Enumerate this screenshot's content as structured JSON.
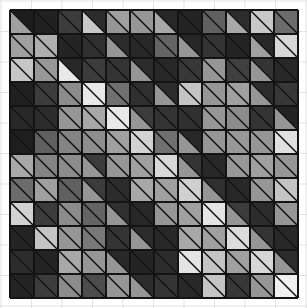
{
  "figure": {
    "kind": "tiling-pattern",
    "canvas": {
      "width": 307,
      "height": 308,
      "background": "#ffffff"
    },
    "background_grid": {
      "visible": true,
      "color": "#e3e3e3",
      "line_width": 1,
      "pitch_x": 30.5,
      "pitch_y": 30.5,
      "origin_x": 1,
      "origin_y": 1
    },
    "tile_block": {
      "origin_x": 10,
      "origin_y": 10,
      "cols": 12,
      "rows": 12,
      "cell_size": 24,
      "split": "anti-diagonal",
      "split_note": "each square tile is divided by the diagonal from its top-left corner to its bottom-right corner; the upper-right triangle and the lower-left triangle are filled independently",
      "seam_color": "#141414",
      "seam_width": 1.6
    },
    "palette": {
      "near_black": "#1d1d1d",
      "very_dark": "#242424",
      "dark": "#2e2e2e",
      "dark_mid": "#3a3a3a",
      "mid": "#555555",
      "mid_light": "#6e6e6e",
      "light": "#8f8f8f",
      "lighter": "#a8a8a8",
      "pale": "#c2c2c2",
      "near_white": "#e8e8e8"
    }
  },
  "chart_data": {
    "type": "heatmap",
    "subtitle": "",
    "xlabel": "",
    "ylabel": "",
    "grid": true,
    "legend": "none",
    "rows": 12,
    "cols": 12,
    "value_range": [
      0,
      255
    ],
    "encoding": "each matrix entry is a pair [upper_right_triangle_gray, lower_left_triangle_gray] given as 8-bit grayscale levels",
    "upper_values": [
      [
        29,
        33,
        60,
        44,
        160,
        150,
        40,
        36,
        96,
        45,
        200,
        108
      ],
      [
        160,
        175,
        36,
        48,
        44,
        40,
        100,
        38,
        52,
        36,
        40,
        215
      ],
      [
        198,
        152,
        40,
        60,
        52,
        44,
        40,
        56,
        150,
        64,
        52,
        40
      ],
      [
        32,
        60,
        140,
        232,
        112,
        48,
        44,
        196,
        150,
        160,
        44,
        56
      ],
      [
        40,
        44,
        150,
        168,
        232,
        60,
        52,
        48,
        150,
        140,
        52,
        36
      ],
      [
        30,
        96,
        132,
        142,
        160,
        210,
        112,
        40,
        150,
        152,
        150,
        224
      ],
      [
        168,
        132,
        140,
        60,
        150,
        160,
        216,
        52,
        40,
        152,
        160,
        150
      ],
      [
        108,
        160,
        96,
        60,
        44,
        168,
        160,
        208,
        48,
        40,
        150,
        196
      ],
      [
        210,
        60,
        140,
        100,
        48,
        40,
        150,
        160,
        228,
        60,
        44,
        150
      ],
      [
        36,
        196,
        150,
        120,
        52,
        44,
        40,
        168,
        160,
        220,
        52,
        40
      ],
      [
        44,
        36,
        168,
        150,
        40,
        36,
        44,
        228,
        196,
        160,
        214,
        44
      ],
      [
        36,
        60,
        140,
        76,
        150,
        44,
        52,
        40,
        196,
        56,
        150,
        240
      ]
    ],
    "lower_values": [
      [
        160,
        33,
        60,
        200,
        150,
        150,
        168,
        36,
        96,
        168,
        200,
        108
      ],
      [
        160,
        175,
        36,
        48,
        150,
        40,
        100,
        150,
        52,
        36,
        160,
        215
      ],
      [
        198,
        152,
        232,
        60,
        52,
        150,
        40,
        56,
        150,
        64,
        150,
        40
      ],
      [
        32,
        60,
        140,
        232,
        112,
        48,
        150,
        196,
        150,
        160,
        150,
        56
      ],
      [
        40,
        44,
        150,
        168,
        232,
        150,
        52,
        48,
        150,
        140,
        52,
        150
      ],
      [
        30,
        96,
        132,
        142,
        160,
        210,
        112,
        150,
        150,
        152,
        150,
        224
      ],
      [
        168,
        132,
        140,
        150,
        150,
        160,
        216,
        150,
        40,
        152,
        160,
        150
      ],
      [
        108,
        160,
        96,
        150,
        44,
        168,
        160,
        208,
        150,
        40,
        150,
        196
      ],
      [
        210,
        60,
        140,
        100,
        150,
        40,
        150,
        160,
        228,
        150,
        44,
        150
      ],
      [
        36,
        196,
        150,
        120,
        52,
        150,
        40,
        168,
        160,
        220,
        150,
        40
      ],
      [
        44,
        36,
        168,
        150,
        150,
        36,
        44,
        228,
        196,
        160,
        214,
        150
      ],
      [
        36,
        60,
        140,
        76,
        150,
        150,
        52,
        40,
        196,
        56,
        150,
        240
      ]
    ]
  }
}
